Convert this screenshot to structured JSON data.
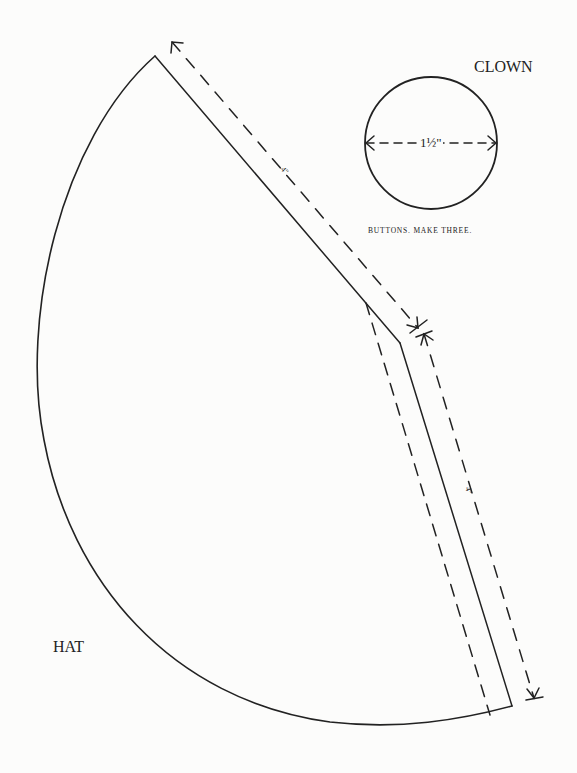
{
  "page": {
    "background": "#fcfcfb",
    "ink_color": "#222222"
  },
  "pieces": {
    "clown_title": "CLOWN",
    "hat": {
      "label": "HAT",
      "shape": "cone sector with fold allowance strip",
      "dimensions": [
        {
          "edge": "upper straight edge",
          "label": "4\""
        },
        {
          "edge": "right straight edge",
          "label": "4\""
        }
      ]
    },
    "buttons": {
      "caption": "BUTTONS. MAKE THREE.",
      "diameter_label": "1½\"",
      "shape": "circle"
    }
  }
}
